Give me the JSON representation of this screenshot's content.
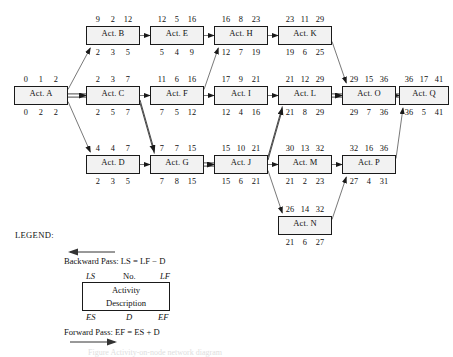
{
  "diagram": {
    "colors": {
      "node_fill": "#f2f2f2",
      "node_stroke": "#1a1a1a",
      "arrow": "#4d4d4d",
      "critical_arrow": "#1a1a1a"
    },
    "nodes": [
      {
        "id": "A",
        "label": "Act. A",
        "ls": "0",
        "no": "1",
        "lf": "2",
        "es": "0",
        "d": "2",
        "ef": "2",
        "x": 14,
        "y": 86,
        "w": 54,
        "h": 19
      },
      {
        "id": "B",
        "label": "Act. B",
        "ls": "9",
        "no": "2",
        "lf": "12",
        "es": "2",
        "d": "3",
        "ef": "5",
        "x": 86,
        "y": 26,
        "w": 54,
        "h": 19
      },
      {
        "id": "C",
        "label": "Act. C",
        "ls": "2",
        "no": "3",
        "lf": "7",
        "es": "2",
        "d": "5",
        "ef": "7",
        "x": 86,
        "y": 86,
        "w": 54,
        "h": 19
      },
      {
        "id": "D",
        "label": "Act. D",
        "ls": "4",
        "no": "4",
        "lf": "7",
        "es": "2",
        "d": "3",
        "ef": "5",
        "x": 86,
        "y": 155,
        "w": 54,
        "h": 19
      },
      {
        "id": "E",
        "label": "Act. E",
        "ls": "12",
        "no": "5",
        "lf": "16",
        "es": "5",
        "d": "4",
        "ef": "9",
        "x": 150,
        "y": 26,
        "w": 54,
        "h": 19
      },
      {
        "id": "F",
        "label": "Act. F",
        "ls": "11",
        "no": "6",
        "lf": "16",
        "es": "7",
        "d": "5",
        "ef": "12",
        "x": 150,
        "y": 86,
        "w": 54,
        "h": 19
      },
      {
        "id": "G",
        "label": "Act. G",
        "ls": "7",
        "no": "7",
        "lf": "15",
        "es": "7",
        "d": "8",
        "ef": "15",
        "x": 150,
        "y": 155,
        "w": 54,
        "h": 19
      },
      {
        "id": "H",
        "label": "Act. H",
        "ls": "16",
        "no": "8",
        "lf": "23",
        "es": "12",
        "d": "7",
        "ef": "19",
        "x": 214,
        "y": 26,
        "w": 54,
        "h": 19
      },
      {
        "id": "I",
        "label": "Act. I",
        "ls": "17",
        "no": "9",
        "lf": "21",
        "es": "12",
        "d": "4",
        "ef": "16",
        "x": 214,
        "y": 86,
        "w": 54,
        "h": 19
      },
      {
        "id": "J",
        "label": "Act. J",
        "ls": "15",
        "no": "10",
        "lf": "21",
        "es": "15",
        "d": "6",
        "ef": "21",
        "x": 214,
        "y": 155,
        "w": 54,
        "h": 19
      },
      {
        "id": "K",
        "label": "Act. K",
        "ls": "23",
        "no": "11",
        "lf": "29",
        "es": "19",
        "d": "6",
        "ef": "25",
        "x": 278,
        "y": 26,
        "w": 54,
        "h": 19
      },
      {
        "id": "L",
        "label": "Act. L",
        "ls": "21",
        "no": "12",
        "lf": "29",
        "es": "21",
        "d": "8",
        "ef": "29",
        "x": 278,
        "y": 86,
        "w": 54,
        "h": 19
      },
      {
        "id": "M",
        "label": "Act. M",
        "ls": "30",
        "no": "13",
        "lf": "32",
        "es": "21",
        "d": "2",
        "ef": "23",
        "x": 278,
        "y": 155,
        "w": 54,
        "h": 19
      },
      {
        "id": "N",
        "label": "Act. N",
        "ls": "26",
        "no": "14",
        "lf": "32",
        "es": "21",
        "d": "6",
        "ef": "27",
        "x": 278,
        "y": 216,
        "w": 54,
        "h": 19
      },
      {
        "id": "O",
        "label": "Act. O",
        "ls": "29",
        "no": "15",
        "lf": "36",
        "es": "29",
        "d": "7",
        "ef": "36",
        "x": 342,
        "y": 86,
        "w": 54,
        "h": 19
      },
      {
        "id": "P",
        "label": "Act. P",
        "ls": "32",
        "no": "16",
        "lf": "36",
        "es": "27",
        "d": "4",
        "ef": "31",
        "x": 342,
        "y": 155,
        "w": 54,
        "h": 19
      },
      {
        "id": "Q",
        "label": "Act. Q",
        "ls": "36",
        "no": "17",
        "lf": "41",
        "es": "36",
        "d": "5",
        "ef": "41",
        "x": 399,
        "y": 86,
        "w": 50,
        "h": 19
      }
    ],
    "edges": [
      {
        "from": "A",
        "to": "B",
        "critical": false
      },
      {
        "from": "A",
        "to": "C",
        "critical": true
      },
      {
        "from": "A",
        "to": "D",
        "critical": false
      },
      {
        "from": "B",
        "to": "E",
        "critical": false
      },
      {
        "from": "C",
        "to": "F",
        "critical": false
      },
      {
        "from": "C",
        "to": "G",
        "critical": true
      },
      {
        "from": "D",
        "to": "G",
        "critical": false
      },
      {
        "from": "E",
        "to": "H",
        "critical": false
      },
      {
        "from": "F",
        "to": "H",
        "critical": false
      },
      {
        "from": "F",
        "to": "I",
        "critical": false
      },
      {
        "from": "G",
        "to": "J",
        "critical": true
      },
      {
        "from": "H",
        "to": "K",
        "critical": false
      },
      {
        "from": "I",
        "to": "L",
        "critical": false
      },
      {
        "from": "J",
        "to": "L",
        "critical": true
      },
      {
        "from": "J",
        "to": "M",
        "critical": false
      },
      {
        "from": "J",
        "to": "N",
        "critical": false
      },
      {
        "from": "K",
        "to": "O",
        "critical": false
      },
      {
        "from": "L",
        "to": "O",
        "critical": true
      },
      {
        "from": "M",
        "to": "P",
        "critical": false
      },
      {
        "from": "N",
        "to": "P",
        "critical": false
      },
      {
        "from": "O",
        "to": "Q",
        "critical": true
      },
      {
        "from": "P",
        "to": "Q",
        "critical": false
      }
    ]
  },
  "legend": {
    "title": "LEGEND:",
    "backward_pass": "Backward Pass:  LS = LF − D",
    "forward_pass": "Forward Pass:  EF = ES + D",
    "top_left": "LS",
    "top_mid": "No.",
    "top_right": "LF",
    "bottom_left": "ES",
    "bottom_mid": "D",
    "bottom_right": "EF",
    "box_line1": "Activity",
    "box_line2": "Description",
    "caption": "Figure   Activity-on-node network diagram"
  }
}
